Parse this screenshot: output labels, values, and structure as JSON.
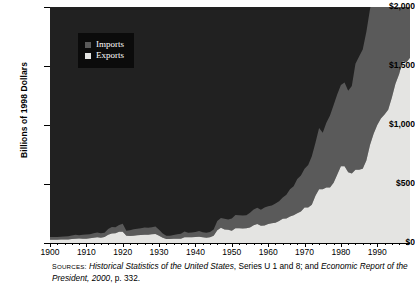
{
  "chart_data": {
    "type": "area",
    "stacked": true,
    "title": "",
    "xlabel": "",
    "ylabel": "Billions of 1998 Dollars",
    "xlim": [
      1900,
      1999
    ],
    "ylim": [
      0,
      2000
    ],
    "grid": false,
    "legend_position": "upper-left-inside",
    "ytick_labels": [
      "$0",
      "$500",
      "$1,000",
      "$1,500",
      "$2,000"
    ],
    "ytick_values": [
      0,
      500,
      1000,
      1500,
      2000
    ],
    "xtick_labels": [
      "1900",
      "1910",
      "1920",
      "1930",
      "1940",
      "1950",
      "1960",
      "1970",
      "1980",
      "1990"
    ],
    "xtick_values": [
      1900,
      1910,
      1920,
      1930,
      1940,
      1950,
      1960,
      1970,
      1980,
      1990
    ],
    "x": [
      1900,
      1901,
      1902,
      1903,
      1904,
      1905,
      1906,
      1907,
      1908,
      1909,
      1910,
      1911,
      1912,
      1913,
      1914,
      1915,
      1916,
      1917,
      1918,
      1919,
      1920,
      1921,
      1922,
      1923,
      1924,
      1925,
      1926,
      1927,
      1928,
      1929,
      1930,
      1931,
      1932,
      1933,
      1934,
      1935,
      1936,
      1937,
      1938,
      1939,
      1940,
      1941,
      1942,
      1943,
      1944,
      1945,
      1946,
      1947,
      1948,
      1949,
      1950,
      1951,
      1952,
      1953,
      1954,
      1955,
      1956,
      1957,
      1958,
      1959,
      1960,
      1961,
      1962,
      1963,
      1964,
      1965,
      1966,
      1967,
      1968,
      1969,
      1970,
      1971,
      1972,
      1973,
      1974,
      1975,
      1976,
      1977,
      1978,
      1979,
      1980,
      1981,
      1982,
      1983,
      1984,
      1985,
      1986,
      1987,
      1988,
      1989,
      1990,
      1991,
      1992,
      1993,
      1994,
      1995,
      1996,
      1997,
      1998,
      1999
    ],
    "series": [
      {
        "name": "Exports",
        "color": "#e4e4e2",
        "values": [
          28,
          28,
          27,
          29,
          29,
          30,
          34,
          37,
          38,
          36,
          36,
          40,
          44,
          48,
          44,
          50,
          70,
          80,
          82,
          95,
          95,
          62,
          60,
          62,
          66,
          68,
          70,
          70,
          74,
          76,
          62,
          44,
          34,
          33,
          36,
          36,
          36,
          48,
          48,
          48,
          50,
          54,
          48,
          44,
          48,
          62,
          108,
          130,
          115,
          112,
          104,
          126,
          125,
          122,
          124,
          132,
          150,
          160,
          146,
          148,
          162,
          168,
          172,
          186,
          205,
          208,
          225,
          235,
          252,
          268,
          300,
          300,
          325,
          400,
          455,
          455,
          470,
          470,
          510,
          580,
          650,
          650,
          600,
          590,
          620,
          620,
          630,
          700,
          830,
          925,
          1000,
          1055,
          1090,
          1130,
          1230,
          1350,
          1430,
          1540,
          1530,
          1570
        ]
      },
      {
        "name": "Imports",
        "color": "#5a5a5a",
        "values": [
          22,
          23,
          24,
          25,
          26,
          28,
          30,
          33,
          28,
          33,
          36,
          35,
          38,
          40,
          38,
          36,
          48,
          55,
          52,
          58,
          68,
          42,
          48,
          54,
          54,
          58,
          62,
          60,
          60,
          64,
          50,
          36,
          28,
          28,
          32,
          38,
          42,
          50,
          38,
          42,
          44,
          48,
          44,
          42,
          46,
          52,
          78,
          82,
          90,
          88,
          104,
          112,
          110,
          112,
          112,
          124,
          134,
          138,
          136,
          152,
          150,
          150,
          162,
          168,
          180,
          200,
          230,
          245,
          290,
          305,
          330,
          360,
          410,
          450,
          520,
          480,
          550,
          610,
          660,
          680,
          690,
          710,
          690,
          740,
          900,
          960,
          1010,
          1090,
          1150,
          1210,
          1250,
          1230,
          1300,
          1400,
          1550,
          1690,
          1790,
          1950,
          1990,
          2020
        ]
      }
    ]
  },
  "axes": {
    "ylabel": "Billions of 1998 Dollars"
  },
  "legend": {
    "items": [
      {
        "label": "Imports",
        "color": "#5a5a5a"
      },
      {
        "label": "Exports",
        "color": "#e4e4e2"
      }
    ]
  },
  "source": {
    "prefix": "Sources:",
    "part1_italic": "Historical Statistics of the United States",
    "part2": ", Series U 1 and 8; and ",
    "part3_italic": "Economic Report of the President, 2000",
    "part4": ", p. 332."
  }
}
